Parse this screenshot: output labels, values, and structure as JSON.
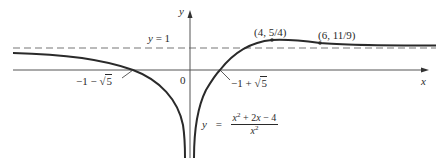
{
  "figure": {
    "axes": {
      "x_label": "x",
      "y_label": "y",
      "origin_label": "0"
    },
    "asymptote": {
      "label_lhs": "y",
      "label_eq": "=",
      "label_rhs": "1",
      "style": "dashed"
    },
    "intercepts": {
      "left": {
        "prefix": "−1 − ",
        "radical": "√",
        "radicand": "5"
      },
      "right": {
        "prefix": "−1 + ",
        "radical": "√",
        "radicand": "5"
      }
    },
    "points": {
      "max": "(4, 5/4)",
      "inflection": "(6, 11/9)"
    },
    "equation": {
      "lhs": "y",
      "eq": "=",
      "numerator_a": "x",
      "numerator_a_exp": "2",
      "numerator_rest": " + 2",
      "numerator_x": "x",
      "numerator_tail": " − 4",
      "denominator": "x",
      "denominator_exp": "2"
    },
    "colors": {
      "curve": "#2a2a2a",
      "axis": "#555555",
      "dashed": "#777777"
    }
  }
}
